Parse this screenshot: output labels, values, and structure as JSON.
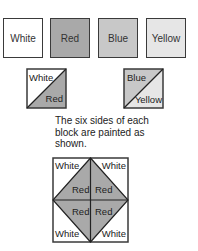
{
  "colors": {
    "white": "#ffffff",
    "red": "#a9a9a9",
    "blue": "#c8c8c8",
    "yellow": "#e6e6e6",
    "border": "#3a3a3a"
  },
  "swatches": [
    {
      "label": "White"
    },
    {
      "label": "Red"
    },
    {
      "label": "Blue"
    },
    {
      "label": "Yellow"
    }
  ],
  "blocks": [
    {
      "top_label": "White",
      "bottom_label": "Red"
    },
    {
      "top_label": "Blue",
      "bottom_label": "Yellow"
    }
  ],
  "caption": {
    "line1": "The six sides of each",
    "line2": "block are painted as",
    "line3": "shown."
  },
  "pattern": {
    "corner_top_left": "White",
    "corner_top_right": "White",
    "corner_bottom_left": "White",
    "corner_bottom_right": "White",
    "center_top_left": "Red",
    "center_top_right": "Red",
    "center_bottom_left": "Red",
    "center_bottom_right": "Red"
  }
}
